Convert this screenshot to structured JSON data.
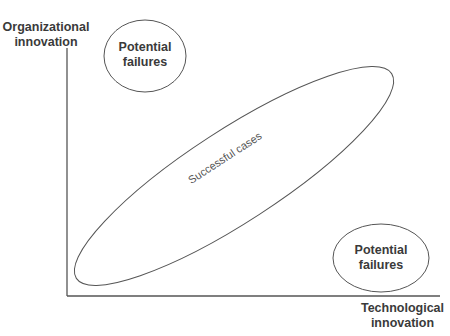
{
  "diagram": {
    "axes": {
      "y_label_line1": "Organizational",
      "y_label_line2": "innovation",
      "x_label_line1": "Technological",
      "x_label_line2": "innovation"
    },
    "regions": [
      {
        "id": "top-left",
        "line1": "Potential",
        "line2": "failures"
      },
      {
        "id": "center",
        "label": "Successful cases"
      },
      {
        "id": "bottom-right",
        "line1": "Potential",
        "line2": "failures"
      }
    ],
    "colors": {
      "stroke": "#555555",
      "text": "#3a3a3a"
    }
  }
}
